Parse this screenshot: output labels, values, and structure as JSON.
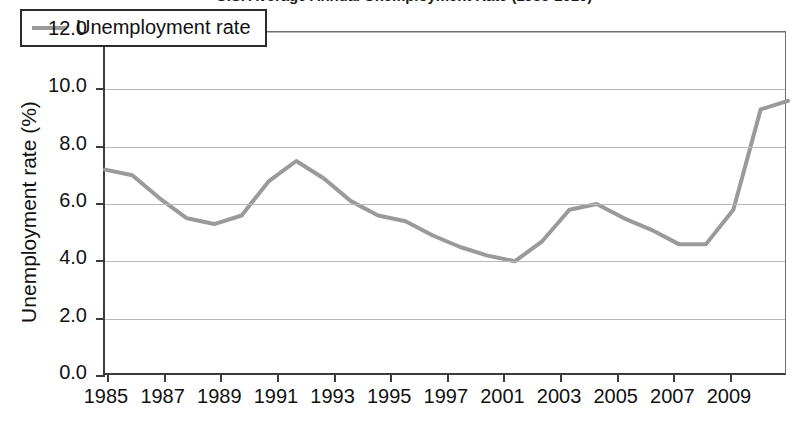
{
  "chart_data": {
    "type": "line",
    "title": "U.S. Average Annual Unemployment Rate (1985-2010)",
    "xlabel": "",
    "ylabel": "Unemployment rate (%)",
    "ylim": [
      0.0,
      12.0
    ],
    "ytick_step": 2.0,
    "ytick_labels": [
      "12.0",
      "10.0",
      "8.0",
      "6.0",
      "4.0",
      "2.0",
      "0.0"
    ],
    "ytick_values": [
      12.0,
      10.0,
      8.0,
      6.0,
      4.0,
      2.0,
      0.0
    ],
    "xtick_labels": [
      "1985",
      "1987",
      "1989",
      "1991",
      "1993",
      "1995",
      "1997",
      "2001",
      "2003",
      "2005",
      "2007",
      "2009"
    ],
    "xtick_values": [
      1985,
      1987,
      1989,
      1991,
      1993,
      1995,
      1997,
      1999,
      2003,
      2005,
      2007,
      2009
    ],
    "xlim": [
      1985,
      2010
    ],
    "grid": true,
    "legend_position": "upper-left",
    "line_color": "#9a9a9a",
    "x": [
      1985,
      1986,
      1987,
      1988,
      1989,
      1990,
      1991,
      1992,
      1993,
      1994,
      1995,
      1996,
      1997,
      1998,
      1999,
      2000,
      2001,
      2002,
      2003,
      2004,
      2005,
      2006,
      2007,
      2008,
      2009,
      2010
    ],
    "series": [
      {
        "name": "Unemployment rate",
        "values": [
          7.2,
          7.0,
          6.2,
          5.5,
          5.3,
          5.6,
          6.8,
          7.5,
          6.9,
          6.1,
          5.6,
          5.4,
          4.9,
          4.5,
          4.2,
          4.0,
          4.7,
          5.8,
          6.0,
          5.5,
          5.1,
          4.6,
          4.6,
          5.8,
          9.3,
          9.6
        ]
      }
    ]
  },
  "legend": {
    "label": "Unemployment rate",
    "swatch_name": "line-swatch"
  }
}
